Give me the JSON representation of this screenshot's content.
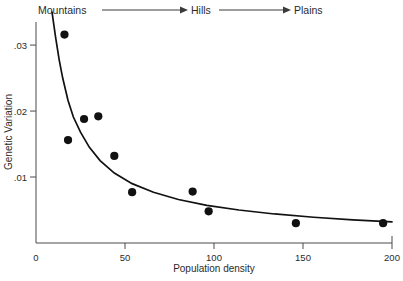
{
  "chart_data": {
    "type": "scatter",
    "title": "",
    "subtitle": "",
    "xlabel": "Population density",
    "ylabel": "Genetic Variation",
    "xlim": [
      0,
      200
    ],
    "ylim": [
      0,
      0.0335
    ],
    "grid": false,
    "legend": null,
    "x_ticks": [
      "0",
      "50",
      "100",
      "150",
      "200"
    ],
    "x_tick_values": [
      0,
      50,
      100,
      150,
      200
    ],
    "y_ticks": [
      ".01",
      ".02",
      ".03"
    ],
    "y_tick_values": [
      0.01,
      0.02,
      0.03
    ],
    "points": [
      {
        "x": 16,
        "y": 0.0316
      },
      {
        "x": 18,
        "y": 0.0156
      },
      {
        "x": 27,
        "y": 0.0188
      },
      {
        "x": 35,
        "y": 0.0192
      },
      {
        "x": 44,
        "y": 0.0132
      },
      {
        "x": 54,
        "y": 0.0077
      },
      {
        "x": 88,
        "y": 0.0078
      },
      {
        "x": 97,
        "y": 0.0048
      },
      {
        "x": 146,
        "y": 0.003
      },
      {
        "x": 195,
        "y": 0.003
      }
    ],
    "fit_curve": {
      "label": "fitted decay curve",
      "x": [
        9,
        11,
        13,
        15,
        18,
        21,
        25,
        30,
        36,
        44,
        54,
        66,
        80,
        96,
        114,
        134,
        156,
        178,
        200
      ],
      "y": [
        0.035,
        0.0312,
        0.0278,
        0.025,
        0.0216,
        0.0191,
        0.0168,
        0.0145,
        0.0125,
        0.0106,
        0.009,
        0.0077,
        0.0066,
        0.0057,
        0.005,
        0.0044,
        0.0039,
        0.0035,
        0.0032
      ]
    },
    "annotations": [
      {
        "name": "gradient-label-mountains",
        "text": "Mountains"
      },
      {
        "name": "gradient-label-hills",
        "text": "Hills"
      },
      {
        "name": "gradient-label-plains",
        "text": "Plains"
      }
    ]
  },
  "axes": {
    "x_title": "Population density",
    "y_title": "Genetic Variation",
    "x_tick_labels": [
      "0",
      "50",
      "100",
      "150",
      "200"
    ],
    "y_tick_labels": [
      ".01",
      ".02",
      ".03"
    ],
    "origin_label": "0"
  },
  "gradient_annotation": {
    "first": "Mountains",
    "second": "Hills",
    "third": "Plains"
  },
  "colors": {
    "point": "#111111",
    "curve": "#111111",
    "axis": "#4a4a4a",
    "text": "#2b2b2b",
    "background": "#ffffff"
  }
}
